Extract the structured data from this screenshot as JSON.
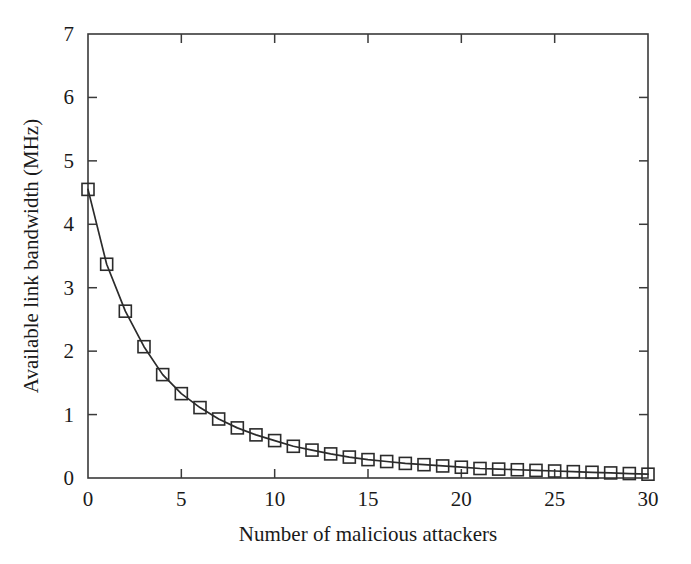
{
  "chart_data": {
    "type": "line",
    "title": "",
    "xlabel": "Number of malicious attackers",
    "ylabel": "Available link bandwidth (MHz)",
    "xlim": [
      0,
      30
    ],
    "ylim": [
      0,
      7
    ],
    "xticks": [
      0,
      5,
      10,
      15,
      20,
      25,
      30
    ],
    "yticks": [
      0,
      1,
      2,
      3,
      4,
      5,
      6,
      7
    ],
    "xtick_labels": [
      "0",
      "5",
      "10",
      "15",
      "20",
      "25",
      "30"
    ],
    "ytick_labels": [
      "0",
      "1",
      "2",
      "3",
      "4",
      "5",
      "6",
      "7"
    ],
    "grid": false,
    "legend": false,
    "marker": "open-square",
    "line_color": "#2b2b2b",
    "marker_color": "#2b2b2b",
    "x": [
      0,
      1,
      2,
      3,
      4,
      5,
      6,
      7,
      8,
      9,
      10,
      11,
      12,
      13,
      14,
      15,
      16,
      17,
      18,
      19,
      20,
      21,
      22,
      23,
      24,
      25,
      26,
      27,
      28,
      29,
      30
    ],
    "series": [
      {
        "name": "Available link bandwidth",
        "values": [
          4.55,
          3.37,
          2.63,
          2.07,
          1.63,
          1.33,
          1.11,
          0.93,
          0.79,
          0.68,
          0.59,
          0.5,
          0.44,
          0.38,
          0.33,
          0.29,
          0.26,
          0.23,
          0.21,
          0.19,
          0.17,
          0.15,
          0.14,
          0.13,
          0.12,
          0.11,
          0.1,
          0.09,
          0.08,
          0.07,
          0.06
        ]
      }
    ]
  },
  "figure": {
    "background_color": "#ffffff",
    "frame_color": "#3a3a3a"
  }
}
